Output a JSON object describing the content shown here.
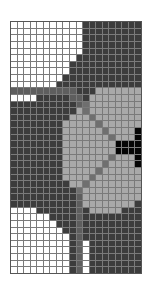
{
  "grid": {
    "cols": 20,
    "rows": 38,
    "palette": {
      "W": "#ffffff",
      "D": "#3c3c3c",
      "M": "#5e5e5e",
      "L": "#a9a9a9",
      "G": "#6f6f6f",
      "B": "#050505"
    },
    "map": [
      "WWWWWWWWWWWDDDDDDDDD",
      "WWWWWWWWWWWDDDDDDDDD",
      "WWWWWWWWWWWDDDDDDDDD",
      "WWWWWWWWWWWDDDDDDDDD",
      "WWWWWWWWWWWDDDDDDDDD",
      "WWWWWWWWWWDDDDDDDDDD",
      "WWWWWWWWWDDDDDDDDDDD",
      "WWWWWWWWWDDDDDDDDDDD",
      "WWWWWWWWDDDDDDDDDDDD",
      "WWWWWWWDDDDDDDDDDDDD",
      "MMMMMMMMMMDDDLLLLLLL",
      "WWWWDDDDDMMDLLLLLLLL",
      "DDDDDDDDDDMGLLLLLLLL",
      "DDDDDDDDDDLGLLLLLLLL",
      "DDDDDDDDDLLLGLLLLLLL",
      "DDDDDDDDLLLLLGLLLLLL",
      "DDDDDDDDLLLLLLGLLLLB",
      "DDDDDDDDLLLLLLLGLLLB",
      "DDDDDDDDLLLLLLLLBBBB",
      "DDDDDDDDLLLLLLLLBBBB",
      "DDDDDDDDLLLLLLLGLLLB",
      "DDDDDDDDLLLLLLGLLLLB",
      "DDDDDDDDLLLLLGLLLLLL",
      "DDDDDDDDLLLLGLLLLLLL",
      "DDDDDDDDDLLGLLLLLLLL",
      "DDDDDDDDDDGLLLLLLLLL",
      "DDDDDDDDDDMLLLLLLLLL",
      "DDDDDDDDDDMLLLLLLLLD",
      "WWWWDDDDDDMDLLLLLDDD",
      "WWWWWWDDDDMDDDDDDDDD",
      "WWWWWWWDDDMDDDDDDDDD",
      "WWWWWWWWDDMDDDDDDDDD",
      "WWWWWWWWWDMDDDDDDDDD",
      "WWWWWWWWWDMWDDDDDDDD",
      "WWWWWWWWWDMWDDDDDDDD",
      "WWWWWWWWWDMWDDDDDDDD",
      "WWWWWWWWWDMWDDDDDDDD",
      "WWWWWWWWWDMWDDDDDDDD"
    ]
  }
}
